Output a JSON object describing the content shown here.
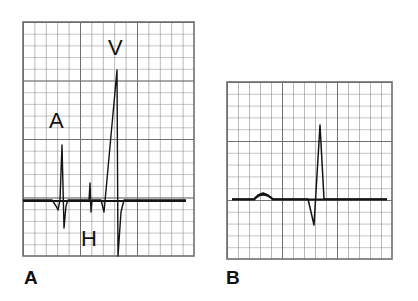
{
  "panels": [
    {
      "id": "A",
      "label": "A",
      "description": "Intracardiac His bundle electrogram",
      "grid": {
        "x": 23,
        "y": 22,
        "width": 171,
        "height": 234,
        "minor": 11.4,
        "major_every": 5
      },
      "wave_labels": [
        {
          "text": "A",
          "meaning": "atrial deflection"
        },
        {
          "text": "H",
          "meaning": "His bundle deflection"
        },
        {
          "text": "V",
          "meaning": "ventricular deflection"
        }
      ],
      "trace": "23,200 52,200 56,206 58,210 60,200 62,145 64,228 66,206 68,200 86,200 89,200 90,183 91,212 92,200 101,200 104,212 117,70 118,256 121,212 124,200 186,200"
    },
    {
      "id": "B",
      "label": "B",
      "description": "Surface ECG (P wave and QRS complex)",
      "grid": {
        "x": 227,
        "y": 82,
        "width": 165,
        "height": 177,
        "minor": 11,
        "major_every": 5
      },
      "wave_labels": [],
      "trace": "232,199 254,199 258,195 263,193 268,195 273,199 308,199 314,225 320,125 324,199 387,199"
    }
  ],
  "colors": {
    "grid": "#8a8a8a",
    "grid_major": "#6f6f6f",
    "trace": "#141414",
    "background": "#ffffff"
  }
}
